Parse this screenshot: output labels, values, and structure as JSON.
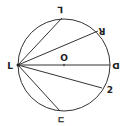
{
  "diagram": {
    "type": "circle-geometry",
    "circle": {
      "cx": 64,
      "cy": 65,
      "r": 46,
      "stroke": "#333333"
    },
    "center_label": "O",
    "labels": {
      "left": "L",
      "top": "⅂",
      "top_right": "ꓤ",
      "right": "ᗡ",
      "bottom_right": "2",
      "bottom": "ㄷ"
    },
    "segments": [
      {
        "from": "left",
        "to": "top"
      },
      {
        "from": "left",
        "to": "top_right"
      },
      {
        "from": "left",
        "to": "right"
      },
      {
        "from": "left",
        "to": "bottom_right"
      },
      {
        "from": "left",
        "to": "bottom"
      }
    ]
  }
}
